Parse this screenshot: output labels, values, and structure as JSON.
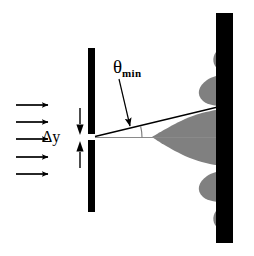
{
  "figure": {
    "name": "single-slit-diffraction-diagram",
    "width": 254,
    "height": 256,
    "background_color": "#ffffff"
  },
  "labels": {
    "theta_symbol": "θ",
    "theta_subscript": "min",
    "slit_width": "Δy"
  },
  "colors": {
    "barrier": "#000000",
    "screen": "#000000",
    "pattern_fill": "#808080",
    "ray": "#000000",
    "axis": "#808080"
  },
  "elements": {
    "incoming_wave_arrows": {
      "name": "incoming-plane-wave-arrows",
      "count": 5,
      "direction": "right",
      "x_start": 16,
      "x_end": 50,
      "y_values": [
        105,
        122,
        139,
        157,
        174
      ]
    },
    "left_barrier": {
      "name": "slit-barrier",
      "x": 88,
      "width": 7,
      "top_segment_y": [
        48,
        134
      ],
      "bottom_segment_y": [
        140,
        212
      ],
      "slit_center_y": 137
    },
    "slit_width_indicator": {
      "name": "delta-y-dimension-arrows",
      "x": 80,
      "top_y": 108,
      "bottom_y": 168,
      "gap_top": 131,
      "gap_bottom": 143
    },
    "right_screen": {
      "name": "detection-screen",
      "x": 216,
      "width": 17,
      "y_top": 13,
      "y_bottom": 243
    },
    "central_axis": {
      "name": "optical-axis-line",
      "from": [
        95,
        137
      ],
      "to": [
        233,
        137
      ]
    },
    "theta_ray": {
      "name": "first-minimum-ray",
      "from": [
        95,
        137
      ],
      "to": [
        222,
        106
      ]
    },
    "theta_arc": {
      "name": "theta-angle-arc",
      "center": [
        95,
        137
      ],
      "radius": 47,
      "start_angle_deg": 0,
      "end_angle_deg": -14
    },
    "theta_pointer": {
      "name": "theta-leader-line",
      "from": [
        122,
        78
      ],
      "to": [
        130,
        127
      ]
    },
    "diffraction_pattern": {
      "name": "diffraction-intensity-curve",
      "axis_x": 233,
      "center_y": 137,
      "fill": "#808080",
      "lobes": [
        {
          "order": 0,
          "center_y": 137,
          "half_height": 30,
          "peak_extent": 83
        },
        {
          "order": 1,
          "center_y": 90,
          "half_height": 17,
          "peak_extent": 31
        },
        {
          "order": -1,
          "center_y": 184,
          "half_height": 17,
          "peak_extent": 31
        },
        {
          "order": 2,
          "center_y": 58,
          "half_height": 13,
          "peak_extent": 19
        },
        {
          "order": -2,
          "center_y": 216,
          "half_height": 13,
          "peak_extent": 19
        }
      ]
    }
  }
}
